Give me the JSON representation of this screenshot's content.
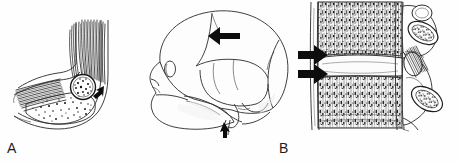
{
  "figure": {
    "type": "anatomical-line-drawing",
    "background_color": "#fefefe",
    "ink_color": "#2a2a2a",
    "arrow_color": "#0d0d0d",
    "panel_count": 3
  },
  "panels": [
    {
      "id": "A",
      "label": "A",
      "subject": "elbow-sagittal-section",
      "description": "Sagittal line drawing of the elbow showing tendon and muscle fibers converging on a rounded ossicle within the joint region",
      "features": [
        "tendon-fibers",
        "muscle-belly",
        "ossicle",
        "cortical-outline",
        "trabecular-stipple"
      ],
      "arrows": [
        {
          "name": "ossicle-arrow",
          "direction": "left",
          "target": "ossicle"
        }
      ]
    },
    {
      "id": "B",
      "label": "B",
      "subject": "skull-lateral-view",
      "description": "Lateral view of the skull showing cranial vault, coronal and lambdoid sutures, orbit, zygomatic arch, maxilla and skull base",
      "features": [
        "cranial-vault",
        "coronal-suture",
        "lambdoid-suture",
        "squamosal-suture",
        "orbit",
        "zygomatic-arch",
        "maxilla",
        "mastoid-process",
        "styloid-process"
      ],
      "arrows": [
        {
          "name": "coronal-suture-arrow",
          "direction": "left",
          "target": "coronal-suture"
        },
        {
          "name": "skull-base-arrow",
          "direction": "up",
          "target": "styloid-process"
        }
      ]
    },
    {
      "id": "C",
      "label": "C",
      "subject": "spine-lateral-section",
      "description": "Lateral sectioned view of two vertebral bodies with intervening disc space, posterior elements, facet joints and spinous processes",
      "features": [
        "vertebral-body-superior",
        "vertebral-body-inferior",
        "intervertebral-disc-space",
        "anterior-longitudinal-ligament",
        "vertebral-endplate",
        "trabecular-bone",
        "spinous-process-superior",
        "spinous-process-inferior",
        "interspinous-ligament",
        "facet-joint"
      ],
      "arrows": [
        {
          "name": "superior-endplate-arrow",
          "direction": "right",
          "target": "superior-endplate"
        },
        {
          "name": "inferior-endplate-arrow",
          "direction": "right",
          "target": "inferior-endplate"
        }
      ]
    }
  ]
}
